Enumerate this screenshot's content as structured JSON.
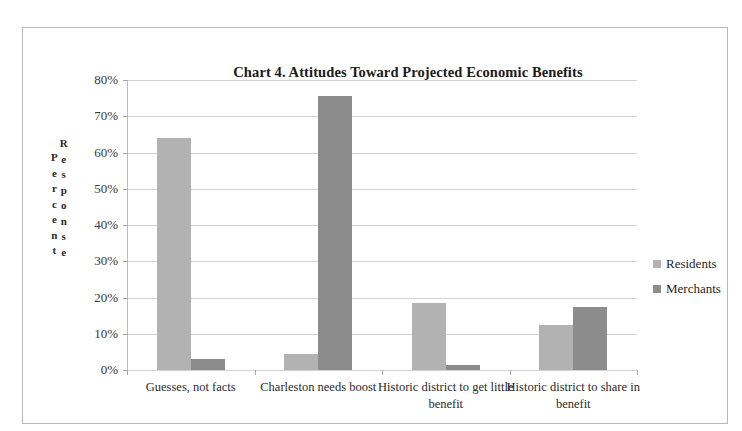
{
  "chart_data": {
    "type": "bar",
    "title": "Chart 4.  Attitudes Toward Projected Economic Benefits",
    "xlabel": "",
    "ylabel": "Percent Response",
    "ylabel_columns": [
      "Percent",
      "Response"
    ],
    "ylim": [
      0,
      80
    ],
    "ytick_labels": [
      "80%",
      "70%",
      "60%",
      "50%",
      "40%",
      "30%",
      "20%",
      "10%",
      "0%"
    ],
    "ytick_values": [
      80,
      70,
      60,
      50,
      40,
      30,
      20,
      10,
      0
    ],
    "grid": true,
    "legend_position": "right",
    "categories": [
      "Guesses, not facts",
      "Charleston needs boost",
      "Historic district to get little benefit",
      "Historic district to share in benefit"
    ],
    "series": [
      {
        "name": "Residents",
        "color": "#b2b2b2",
        "values": [
          64.0,
          4.5,
          18.5,
          12.5
        ]
      },
      {
        "name": "Merchants",
        "color": "#8c8c8c",
        "values": [
          3.0,
          75.5,
          1.5,
          17.5
        ]
      }
    ]
  }
}
